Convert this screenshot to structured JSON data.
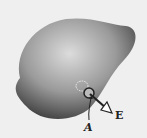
{
  "figure": {
    "colors": {
      "background": "#efefef",
      "body_light": "#d8d8d8",
      "body_dark": "#3a3a3a",
      "ink": "#222222"
    },
    "labels": {
      "area": "A",
      "field": "E"
    }
  }
}
